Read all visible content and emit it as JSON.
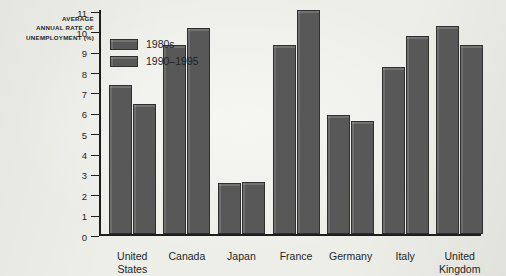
{
  "chart_data": {
    "type": "bar",
    "title": "",
    "subtitle": "",
    "xlabel": "",
    "ylabel": "AVERAGE\nANNUAL RATE OF\nUNEMPLOYMENT (%)",
    "ylabel_lines": [
      "AVERAGE",
      "ANNUAL RATE OF",
      "UNEMPLOYMENT (%)"
    ],
    "ylim": [
      0,
      11
    ],
    "yticks": [
      0,
      1,
      2,
      3,
      4,
      5,
      6,
      7,
      8,
      9,
      10,
      11
    ],
    "ytick_labels": [
      "0",
      "1",
      "2",
      "3",
      "4",
      "5",
      "6",
      "7",
      "8",
      "9",
      "10",
      "11"
    ],
    "grid": false,
    "legend_position": "top-left-inside",
    "categories": [
      "United\nStates",
      "Canada",
      "Japan",
      "France",
      "Germany",
      "Italy",
      "United\nKingdom"
    ],
    "series": [
      {
        "name": "1980s",
        "color": "#585858",
        "values": [
          7.3,
          9.3,
          2.5,
          9.3,
          5.85,
          8.2,
          10.2
        ]
      },
      {
        "name": "1990–1995",
        "color": "#585858",
        "values": [
          6.4,
          10.1,
          2.55,
          11.0,
          5.55,
          9.7,
          9.3
        ]
      }
    ],
    "colors": {
      "background": "#eeeee9",
      "bar_fill": "#585858",
      "bar_edge": "#2f2f2f",
      "axis": "#1e1e1e",
      "text": "#1f1f1f"
    }
  }
}
